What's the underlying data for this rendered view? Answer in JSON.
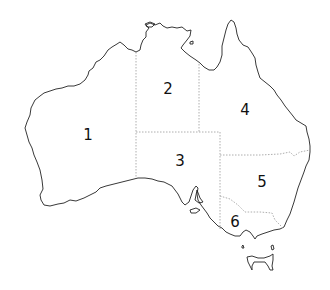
{
  "map": {
    "subject": "Australia",
    "regions": [
      {
        "id": "1",
        "label": "1",
        "x": 88,
        "y": 135
      },
      {
        "id": "2",
        "label": "2",
        "x": 168,
        "y": 89
      },
      {
        "id": "3",
        "label": "3",
        "x": 180,
        "y": 161
      },
      {
        "id": "4",
        "label": "4",
        "x": 245,
        "y": 110
      },
      {
        "id": "5",
        "label": "5",
        "x": 262,
        "y": 182
      },
      {
        "id": "6",
        "label": "6",
        "x": 235,
        "y": 222
      }
    ],
    "colors": {
      "coast": "#222222",
      "border": "#999999",
      "background": "#ffffff"
    }
  }
}
